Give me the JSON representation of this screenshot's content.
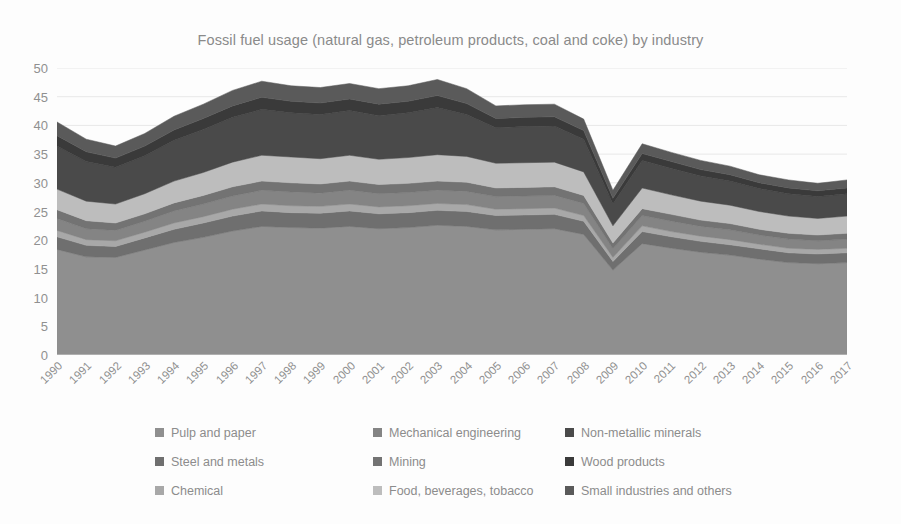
{
  "chart_data": {
    "type": "area",
    "stacked": true,
    "title": "Fossil fuel usage (natural gas, petroleum products, coal and coke) by industry",
    "xlabel": "",
    "ylabel": "",
    "ylim": [
      0,
      50
    ],
    "yticks": [
      0,
      5,
      10,
      15,
      20,
      25,
      30,
      35,
      40,
      45,
      50
    ],
    "grid": true,
    "legend_position": "bottom",
    "legend_columns": 3,
    "categories": [
      "1990",
      "1991",
      "1992",
      "1993",
      "1994",
      "1995",
      "1996",
      "1997",
      "1998",
      "1999",
      "2000",
      "2001",
      "2002",
      "2003",
      "2004",
      "2005",
      "2006",
      "2007",
      "2008",
      "2009",
      "2010",
      "2011",
      "2012",
      "2013",
      "2014",
      "2015",
      "2016",
      "2017"
    ],
    "series": [
      {
        "name": "Pulp and paper",
        "color": "#8f8f8f",
        "values": [
          18.4,
          17.1,
          17.0,
          18.3,
          19.6,
          20.5,
          21.6,
          22.4,
          22.2,
          22.1,
          22.4,
          22.0,
          22.2,
          22.6,
          22.4,
          21.8,
          21.9,
          22.0,
          21.0,
          14.8,
          19.4,
          18.6,
          17.9,
          17.4,
          16.7,
          16.1,
          15.9,
          16.1
        ]
      },
      {
        "name": "Steel and metals",
        "color": "#6f6f6f",
        "values": [
          2.2,
          2.0,
          1.9,
          2.1,
          2.3,
          2.5,
          2.6,
          2.7,
          2.6,
          2.6,
          2.7,
          2.6,
          2.6,
          2.6,
          2.6,
          2.5,
          2.5,
          2.5,
          2.3,
          1.5,
          2.1,
          2.0,
          1.9,
          1.8,
          1.8,
          1.7,
          1.7,
          1.7
        ]
      },
      {
        "name": "Chemical",
        "color": "#a8a8a8",
        "values": [
          1.1,
          1.0,
          1.0,
          1.0,
          1.1,
          1.1,
          1.2,
          1.2,
          1.2,
          1.2,
          1.2,
          1.2,
          1.2,
          1.2,
          1.2,
          1.1,
          1.1,
          1.1,
          1.0,
          0.7,
          1.0,
          0.9,
          0.9,
          0.9,
          0.8,
          0.8,
          0.8,
          0.8
        ]
      },
      {
        "name": "Mechanical engineering",
        "color": "#848484",
        "values": [
          2.1,
          1.9,
          1.8,
          1.9,
          2.1,
          2.2,
          2.3,
          2.4,
          2.4,
          2.3,
          2.4,
          2.3,
          2.3,
          2.3,
          2.3,
          2.2,
          2.2,
          2.2,
          2.1,
          1.5,
          1.8,
          1.8,
          1.7,
          1.7,
          1.6,
          1.6,
          1.5,
          1.6
        ]
      },
      {
        "name": "Mining",
        "color": "#737373",
        "values": [
          1.5,
          1.4,
          1.3,
          1.3,
          1.4,
          1.5,
          1.6,
          1.6,
          1.6,
          1.6,
          1.6,
          1.6,
          1.6,
          1.6,
          1.6,
          1.5,
          1.5,
          1.5,
          1.4,
          1.0,
          1.2,
          1.2,
          1.1,
          1.1,
          1.0,
          1.0,
          1.0,
          1.0
        ]
      },
      {
        "name": "Food, beverages, tobacco",
        "color": "#bdbdbd",
        "values": [
          3.6,
          3.4,
          3.3,
          3.5,
          3.8,
          4.0,
          4.3,
          4.5,
          4.5,
          4.4,
          4.5,
          4.4,
          4.5,
          4.6,
          4.5,
          4.3,
          4.3,
          4.3,
          4.1,
          3.0,
          3.6,
          3.4,
          3.3,
          3.2,
          3.1,
          3.0,
          2.9,
          3.0
        ]
      },
      {
        "name": "Non-metallic minerals",
        "color": "#4a4a4a",
        "values": [
          7.5,
          6.9,
          6.4,
          6.6,
          7.1,
          7.5,
          7.8,
          8.0,
          7.7,
          7.7,
          7.8,
          7.6,
          7.8,
          8.2,
          7.3,
          6.2,
          6.3,
          6.3,
          5.7,
          3.8,
          4.8,
          4.6,
          4.4,
          4.2,
          4.0,
          3.9,
          3.8,
          3.9
        ]
      },
      {
        "name": "Wood products",
        "color": "#3a3a3a",
        "values": [
          1.8,
          1.7,
          1.6,
          1.7,
          1.8,
          1.9,
          2.0,
          2.1,
          2.0,
          2.0,
          2.0,
          2.0,
          2.0,
          2.1,
          1.9,
          1.6,
          1.6,
          1.6,
          1.5,
          1.0,
          1.2,
          1.2,
          1.1,
          1.1,
          1.0,
          1.0,
          1.0,
          1.0
        ]
      },
      {
        "name": "Small industries and others",
        "color": "#5a5a5a",
        "values": [
          2.4,
          2.2,
          2.1,
          2.2,
          2.4,
          2.5,
          2.7,
          2.8,
          2.7,
          2.7,
          2.7,
          2.7,
          2.7,
          2.8,
          2.6,
          2.2,
          2.2,
          2.2,
          2.0,
          1.4,
          1.7,
          1.6,
          1.6,
          1.5,
          1.4,
          1.4,
          1.3,
          1.4
        ]
      }
    ],
    "totals": [
      40.6,
      37.6,
      36.4,
      38.6,
      41.6,
      43.7,
      46.1,
      47.7,
      46.9,
      46.6,
      47.3,
      46.4,
      46.9,
      48.0,
      46.4,
      43.4,
      43.6,
      43.7,
      41.1,
      28.7,
      36.8,
      35.3,
      33.9,
      32.9,
      31.4,
      30.5,
      29.9,
      30.5
    ]
  },
  "legend": {
    "items": [
      {
        "label": "Pulp and paper",
        "color": "#8f8f8f"
      },
      {
        "label": "Steel and metals",
        "color": "#6f6f6f"
      },
      {
        "label": "Chemical",
        "color": "#a8a8a8"
      },
      {
        "label": "Mechanical engineering",
        "color": "#848484"
      },
      {
        "label": "Mining",
        "color": "#737373"
      },
      {
        "label": "Food, beverages, tobacco",
        "color": "#bdbdbd"
      },
      {
        "label": "Non-metallic minerals",
        "color": "#4a4a4a"
      },
      {
        "label": "Wood products",
        "color": "#3a3a3a"
      },
      {
        "label": "Small industries and others",
        "color": "#5a5a5a"
      }
    ]
  },
  "axis": {
    "y_labels": [
      "50",
      "45",
      "40",
      "35",
      "30",
      "25",
      "20",
      "15",
      "10",
      "5",
      "0"
    ],
    "x_labels": [
      "1990",
      "1991",
      "1992",
      "1993",
      "1994",
      "1995",
      "1996",
      "1997",
      "1998",
      "1999",
      "2000",
      "2001",
      "2002",
      "2003",
      "2004",
      "2005",
      "2006",
      "2007",
      "2008",
      "2009",
      "2010",
      "2011",
      "2012",
      "2013",
      "2014",
      "2015",
      "2016",
      "2017"
    ]
  },
  "colors": {
    "background": "#fdfdfd",
    "grid": "#e8e8e8",
    "axis_line": "#d0d0d0",
    "text": "#909090"
  }
}
